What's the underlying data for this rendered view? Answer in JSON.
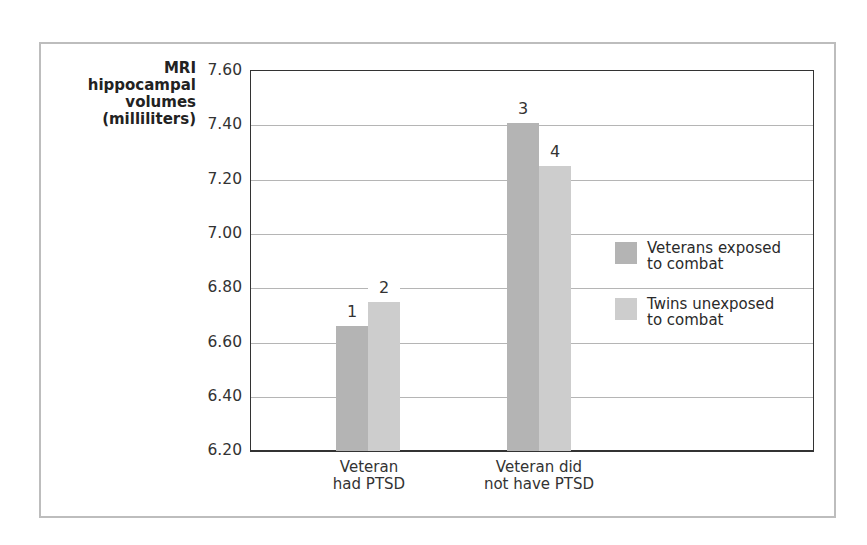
{
  "chart_data": {
    "type": "bar",
    "title": "",
    "xlabel": "",
    "ylabel": "MRI hippocampal volumes (milliliters)",
    "ylabel_lines": [
      "MRI",
      "hippocampal",
      "volumes",
      "(milliliters)"
    ],
    "ylim": [
      6.2,
      7.6
    ],
    "yticks": [
      "7.60",
      "7.40",
      "7.20",
      "7.00",
      "6.80",
      "6.60",
      "6.40",
      "6.20"
    ],
    "grid": true,
    "legend_position": "right",
    "categories": [
      "Veteran had PTSD",
      "Veteran did not have PTSD"
    ],
    "category_lines": [
      [
        "Veteran",
        "had PTSD"
      ],
      [
        "Veteran did",
        "not have PTSD"
      ]
    ],
    "series": [
      {
        "name": "Veterans exposed to combat",
        "legend_lines": [
          "Veterans exposed",
          "to combat"
        ],
        "color": "#b4b4b4",
        "values": [
          6.66,
          7.41
        ],
        "labels": [
          "1",
          "3"
        ]
      },
      {
        "name": "Twins unexposed to combat",
        "legend_lines": [
          "Twins unexposed",
          "to combat"
        ],
        "color": "#cdcdcd",
        "values": [
          6.75,
          7.25
        ],
        "labels": [
          "2",
          "4"
        ]
      }
    ]
  }
}
